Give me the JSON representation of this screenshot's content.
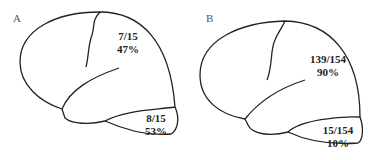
{
  "panels": [
    {
      "label": "A",
      "upper": {
        "fraction": "7/15",
        "percent": "47%"
      },
      "lower": {
        "fraction": "8/15",
        "percent": "53%"
      }
    },
    {
      "label": "B",
      "upper": {
        "fraction": "139/154",
        "percent": "90%"
      },
      "lower": {
        "fraction": "15/154",
        "percent": "10%"
      }
    }
  ],
  "colors": {
    "stroke": "#222222",
    "background": "#ffffff"
  }
}
